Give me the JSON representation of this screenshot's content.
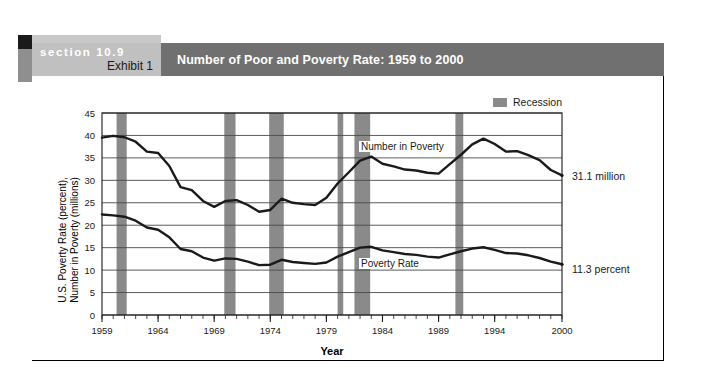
{
  "exhibit": {
    "section_label": "section 10.9",
    "exhibit_label": "Exhibit 1",
    "title": "Number of Poor and Poverty Rate: 1959 to 2000"
  },
  "legend": {
    "recession_label": "Recession",
    "recession_color": "#8a8a8a"
  },
  "annotations": {
    "end_number_label": "31.1 million",
    "end_rate_label": "11.3 percent",
    "series_label_number": "Number in Poverty",
    "series_label_rate": "Poverty Rate"
  },
  "chart_data": {
    "type": "line",
    "title": "Number of Poor and Poverty Rate: 1959 to 2000",
    "xlabel": "Year",
    "ylabel": "U.S. Poverty Rate (percent), Number in Poverty (millions)",
    "ylabel_line1": "U.S. Poverty Rate (percent),",
    "ylabel_line2": "Number in Poverty (millions)",
    "xlim": [
      1959,
      2000
    ],
    "ylim": [
      0,
      45
    ],
    "yticks": [
      0,
      5,
      10,
      15,
      20,
      25,
      30,
      35,
      40,
      45
    ],
    "xticks": [
      1959,
      1964,
      1969,
      1974,
      1979,
      1984,
      1989,
      1994,
      2000
    ],
    "grid": true,
    "legend_position": "top-right",
    "x": [
      1959,
      1960,
      1961,
      1962,
      1963,
      1964,
      1965,
      1966,
      1967,
      1968,
      1969,
      1970,
      1971,
      1972,
      1973,
      1974,
      1975,
      1976,
      1977,
      1978,
      1979,
      1980,
      1981,
      1982,
      1983,
      1984,
      1985,
      1986,
      1987,
      1988,
      1989,
      1990,
      1991,
      1992,
      1993,
      1994,
      1995,
      1996,
      1997,
      1998,
      1999,
      2000
    ],
    "series": [
      {
        "name": "Number in Poverty",
        "unit": "millions",
        "values": [
          39.5,
          39.9,
          39.6,
          38.6,
          36.4,
          36.1,
          33.2,
          28.5,
          27.8,
          25.4,
          24.1,
          25.4,
          25.6,
          24.5,
          23.0,
          23.4,
          25.9,
          25.0,
          24.7,
          24.5,
          26.1,
          29.3,
          31.8,
          34.4,
          35.3,
          33.7,
          33.1,
          32.4,
          32.2,
          31.7,
          31.5,
          33.6,
          35.7,
          38.0,
          39.3,
          38.1,
          36.4,
          36.5,
          35.6,
          34.5,
          32.3,
          31.1
        ]
      },
      {
        "name": "Poverty Rate",
        "unit": "percent",
        "values": [
          22.4,
          22.2,
          21.9,
          21.0,
          19.5,
          19.0,
          17.3,
          14.7,
          14.2,
          12.8,
          12.1,
          12.6,
          12.5,
          11.9,
          11.1,
          11.2,
          12.3,
          11.8,
          11.6,
          11.4,
          11.7,
          13.0,
          14.0,
          15.0,
          15.2,
          14.4,
          14.0,
          13.6,
          13.4,
          13.0,
          12.8,
          13.5,
          14.2,
          14.8,
          15.1,
          14.5,
          13.8,
          13.7,
          13.3,
          12.7,
          11.9,
          11.3
        ]
      }
    ],
    "recessions": [
      {
        "start": 1960.3,
        "end": 1961.2
      },
      {
        "start": 1969.9,
        "end": 1970.9
      },
      {
        "start": 1973.9,
        "end": 1975.2
      },
      {
        "start": 1980.0,
        "end": 1980.5
      },
      {
        "start": 1981.5,
        "end": 1982.9
      },
      {
        "start": 1990.5,
        "end": 1991.2
      }
    ]
  }
}
